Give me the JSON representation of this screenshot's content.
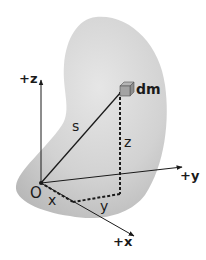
{
  "diagram": {
    "colors": {
      "body_fill": "#c9c9c9",
      "body_highlight": "#e2e2e2",
      "line": "#1a1a1a",
      "cube": "#9a9a9a"
    },
    "labels": {
      "z_axis": "+z",
      "y_axis": "+y",
      "x_axis": "+x",
      "origin": "O",
      "mass_element": "dm",
      "position_vector": "s",
      "z_component": "z",
      "x_component": "x",
      "y_component": "y"
    },
    "elements": {
      "body": "irregular rigid body (shaded blob)",
      "position_vector": "solid line from O to dm",
      "projections": "dashed lines x, y, z from O to dm"
    }
  }
}
